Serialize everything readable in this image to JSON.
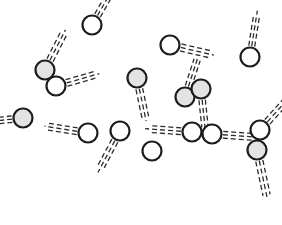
{
  "canvas": {
    "width": 282,
    "height": 225,
    "background": "#ffffff",
    "title": "particle-motion-diagram"
  },
  "style": {
    "circle_stroke": "#1d1d1f",
    "circle_stroke_width": 2.2,
    "circle_radius": 9.5,
    "fill_shaded": "#e3e3e3",
    "fill_open": "#ffffff",
    "trail_color": "#2a2a2e",
    "trail_width": 1.3,
    "trail_dash": "5,3",
    "trail_strands": 3,
    "trail_strand_gap": 3.4,
    "trail_length": 30
  },
  "particles": [
    {
      "id": "particle-1",
      "cx": 92,
      "cy": 25,
      "fill": "open",
      "trail": true,
      "angle": 60,
      "length": 28,
      "gap": 3.2
    },
    {
      "id": "particle-2",
      "cx": 45,
      "cy": 70,
      "fill": "shaded",
      "trail": true,
      "angle": 63,
      "length": 34,
      "gap": 3.4
    },
    {
      "id": "particle-3",
      "cx": 56,
      "cy": 86,
      "fill": "open",
      "trail": true,
      "angle": 16,
      "length": 34,
      "gap": 3.4
    },
    {
      "id": "particle-4",
      "cx": 250,
      "cy": 57,
      "fill": "open",
      "trail": true,
      "angle": 81,
      "length": 36,
      "gap": 3.0
    },
    {
      "id": "particle-5",
      "cx": 170,
      "cy": 45,
      "fill": "open",
      "trail": true,
      "angle": -13,
      "length": 34,
      "gap": 3.6
    },
    {
      "id": "particle-6",
      "cx": 137,
      "cy": 78,
      "fill": "shaded",
      "trail": true,
      "angle": -78,
      "length": 33,
      "gap": 3.4
    },
    {
      "id": "particle-7",
      "cx": 185,
      "cy": 97,
      "fill": "shaded",
      "trail": true,
      "angle": 72,
      "length": 32,
      "gap": 3.2
    },
    {
      "id": "particle-8",
      "cx": 201,
      "cy": 89,
      "fill": "shaded",
      "trail": true,
      "angle": -84,
      "length": 31,
      "gap": 3.2
    },
    {
      "id": "particle-9",
      "cx": 23,
      "cy": 118,
      "fill": "shaded",
      "trail": true,
      "angle": 186,
      "length": 24,
      "gap": 3.2
    },
    {
      "id": "particle-10",
      "cx": 88,
      "cy": 133,
      "fill": "open",
      "trail": true,
      "angle": 171,
      "length": 33,
      "gap": 3.4
    },
    {
      "id": "particle-11",
      "cx": 120,
      "cy": 131,
      "fill": "open",
      "trail": true,
      "angle": -118,
      "length": 36,
      "gap": 3.4
    },
    {
      "id": "particle-12",
      "cx": 152,
      "cy": 151,
      "fill": "open",
      "trail": false,
      "angle": 0,
      "length": 0,
      "gap": 0
    },
    {
      "id": "particle-13",
      "cx": 192,
      "cy": 132,
      "fill": "open",
      "trail": true,
      "angle": 176,
      "length": 36,
      "gap": 3.4
    },
    {
      "id": "particle-14",
      "cx": 212,
      "cy": 134,
      "fill": "open",
      "trail": true,
      "angle": -4,
      "length": 36,
      "gap": 3.4
    },
    {
      "id": "particle-15",
      "cx": 260,
      "cy": 130,
      "fill": "open",
      "trail": true,
      "angle": 48,
      "length": 34,
      "gap": 3.4
    },
    {
      "id": "particle-16",
      "cx": 257,
      "cy": 150,
      "fill": "shaded",
      "trail": true,
      "angle": -78,
      "length": 40,
      "gap": 3.6
    }
  ]
}
